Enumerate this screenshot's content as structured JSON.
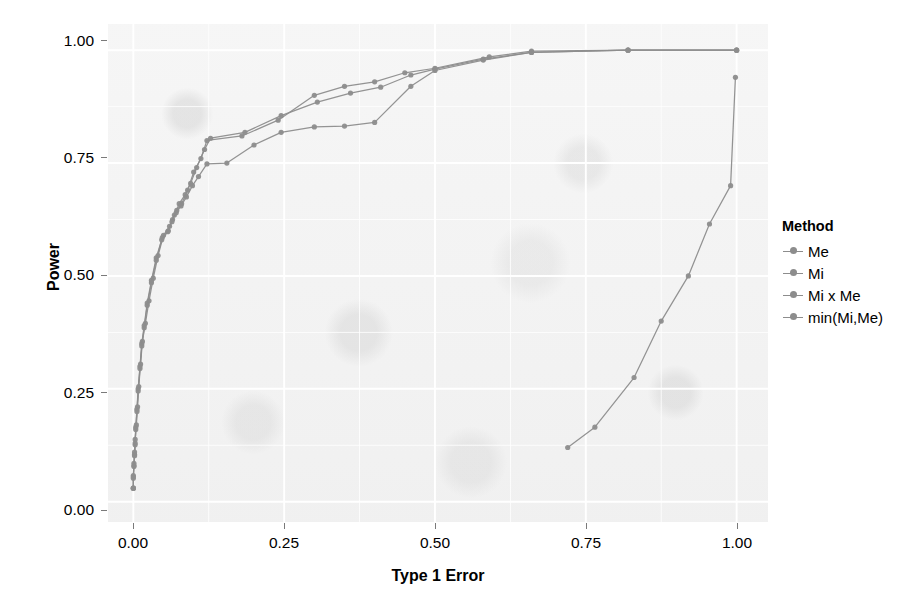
{
  "chart_data": {
    "type": "line",
    "title": "",
    "xlabel": "Type 1 Error",
    "ylabel": "Power",
    "xlim": [
      -0.042,
      1.052
    ],
    "ylim": [
      -0.045,
      1.058
    ],
    "xticks": [
      "0.00",
      "0.25",
      "0.50",
      "0.75",
      "1.00"
    ],
    "xtick_values": [
      0.0,
      0.25,
      0.5,
      0.75,
      1.0
    ],
    "yticks": [
      "0.00",
      "0.25",
      "0.50",
      "0.75",
      "1.00"
    ],
    "ytick_values": [
      0.0,
      0.25,
      0.5,
      0.75,
      1.0
    ],
    "grid": true,
    "legend_position": "right",
    "legend_title": "Method",
    "panel_background": "#f1f1f1",
    "grid_color": "#ffffff",
    "series": [
      {
        "name": "Me",
        "color": "#8d8d8d",
        "points": [
          [
            0.0,
            0.03
          ],
          [
            0.0,
            0.055
          ],
          [
            0.001,
            0.08
          ],
          [
            0.002,
            0.105
          ],
          [
            0.003,
            0.13
          ],
          [
            0.004,
            0.165
          ],
          [
            0.006,
            0.205
          ],
          [
            0.008,
            0.25
          ],
          [
            0.011,
            0.3
          ],
          [
            0.014,
            0.35
          ],
          [
            0.018,
            0.39
          ],
          [
            0.023,
            0.44
          ],
          [
            0.03,
            0.49
          ],
          [
            0.038,
            0.54
          ],
          [
            0.048,
            0.585
          ],
          [
            0.058,
            0.6
          ],
          [
            0.065,
            0.625
          ],
          [
            0.072,
            0.645
          ],
          [
            0.08,
            0.66
          ],
          [
            0.09,
            0.69
          ],
          [
            0.1,
            0.73
          ],
          [
            0.112,
            0.76
          ],
          [
            0.122,
            0.8
          ],
          [
            0.18,
            0.81
          ],
          [
            0.24,
            0.845
          ],
          [
            0.3,
            0.9
          ],
          [
            0.35,
            0.92
          ],
          [
            0.4,
            0.93
          ],
          [
            0.45,
            0.95
          ],
          [
            0.5,
            0.96
          ],
          [
            0.59,
            0.985
          ],
          [
            0.66,
            0.998
          ],
          [
            0.82,
            1.0
          ],
          [
            1.0,
            1.0
          ]
        ]
      },
      {
        "name": "Mi",
        "color": "#8d8d8d",
        "points": [
          [
            0.0,
            0.03
          ],
          [
            0.0,
            0.058
          ],
          [
            0.001,
            0.085
          ],
          [
            0.002,
            0.11
          ],
          [
            0.003,
            0.138
          ],
          [
            0.005,
            0.17
          ],
          [
            0.007,
            0.21
          ],
          [
            0.009,
            0.255
          ],
          [
            0.012,
            0.305
          ],
          [
            0.015,
            0.355
          ],
          [
            0.02,
            0.395
          ],
          [
            0.026,
            0.445
          ],
          [
            0.033,
            0.495
          ],
          [
            0.041,
            0.545
          ],
          [
            0.05,
            0.59
          ],
          [
            0.06,
            0.61
          ],
          [
            0.068,
            0.635
          ],
          [
            0.076,
            0.66
          ],
          [
            0.086,
            0.68
          ],
          [
            0.095,
            0.705
          ],
          [
            0.105,
            0.74
          ],
          [
            0.118,
            0.78
          ],
          [
            0.128,
            0.805
          ],
          [
            0.185,
            0.818
          ],
          [
            0.245,
            0.855
          ],
          [
            0.305,
            0.885
          ],
          [
            0.36,
            0.905
          ],
          [
            0.41,
            0.918
          ],
          [
            0.46,
            0.945
          ],
          [
            0.5,
            0.958
          ],
          [
            0.58,
            0.98
          ],
          [
            0.66,
            0.995
          ],
          [
            0.82,
            1.0
          ],
          [
            1.0,
            1.0
          ]
        ]
      },
      {
        "name": "Mi x Me",
        "color": "#8d8d8d",
        "points": [
          [
            0.0,
            0.03
          ],
          [
            0.0,
            0.052
          ],
          [
            0.001,
            0.078
          ],
          [
            0.002,
            0.102
          ],
          [
            0.003,
            0.126
          ],
          [
            0.004,
            0.16
          ],
          [
            0.006,
            0.2
          ],
          [
            0.008,
            0.245
          ],
          [
            0.011,
            0.295
          ],
          [
            0.014,
            0.345
          ],
          [
            0.018,
            0.385
          ],
          [
            0.023,
            0.435
          ],
          [
            0.03,
            0.485
          ],
          [
            0.038,
            0.535
          ],
          [
            0.047,
            0.58
          ],
          [
            0.057,
            0.598
          ],
          [
            0.064,
            0.62
          ],
          [
            0.071,
            0.64
          ],
          [
            0.079,
            0.655
          ],
          [
            0.088,
            0.675
          ],
          [
            0.098,
            0.7
          ],
          [
            0.108,
            0.72
          ],
          [
            0.122,
            0.748
          ],
          [
            0.155,
            0.75
          ],
          [
            0.2,
            0.79
          ],
          [
            0.245,
            0.818
          ],
          [
            0.3,
            0.83
          ],
          [
            0.35,
            0.832
          ],
          [
            0.4,
            0.84
          ],
          [
            0.46,
            0.92
          ],
          [
            0.5,
            0.955
          ],
          [
            0.58,
            0.978
          ],
          [
            0.66,
            0.995
          ],
          [
            0.82,
            1.0
          ],
          [
            1.0,
            1.0
          ]
        ]
      },
      {
        "name": "min(Mi,Me)",
        "color": "#8d8d8d",
        "points": [
          [
            0.72,
            0.12
          ],
          [
            0.765,
            0.165
          ],
          [
            0.83,
            0.275
          ],
          [
            0.875,
            0.4
          ],
          [
            0.92,
            0.5
          ],
          [
            0.955,
            0.615
          ],
          [
            0.99,
            0.7
          ],
          [
            0.998,
            0.94
          ]
        ]
      }
    ],
    "legend_entries": [
      {
        "label": "Me",
        "color": "#8d8d8d"
      },
      {
        "label": "Mi",
        "color": "#8d8d8d"
      },
      {
        "label": "Mi x Me",
        "color": "#8d8d8d"
      },
      {
        "label": "min(Mi,Me)",
        "color": "#8d8d8d"
      }
    ]
  }
}
